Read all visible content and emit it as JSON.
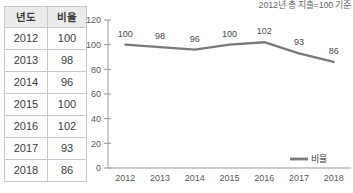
{
  "table": {
    "headers": [
      "년도",
      "비율"
    ],
    "rows": [
      [
        "2012",
        "100"
      ],
      [
        "2013",
        "98"
      ],
      [
        "2014",
        "96"
      ],
      [
        "2015",
        "100"
      ],
      [
        "2016",
        "102"
      ],
      [
        "2017",
        "93"
      ],
      [
        "2018",
        "86"
      ]
    ]
  },
  "chart_data": {
    "type": "line",
    "title": "2012년 총 지출=100 기준",
    "xlabel": "",
    "ylabel": "",
    "categories": [
      "2012",
      "2013",
      "2014",
      "2015",
      "2016",
      "2017",
      "2018"
    ],
    "series": [
      {
        "name": "비율",
        "values": [
          100,
          98,
          96,
          100,
          102,
          93,
          86
        ],
        "color": "#7a7a7a"
      }
    ],
    "ylim": [
      0,
      120
    ],
    "yticks": [
      0,
      20,
      40,
      60,
      80,
      100,
      120
    ],
    "ytick_labels": [
      "0",
      "20",
      "40",
      "60",
      "80",
      "100",
      "120"
    ],
    "point_labels": [
      "100",
      "98",
      "96",
      "100",
      "102",
      "93",
      "86"
    ],
    "grid": false,
    "legend_position": "bottom-right",
    "axis_color": "#9a9a9a"
  }
}
